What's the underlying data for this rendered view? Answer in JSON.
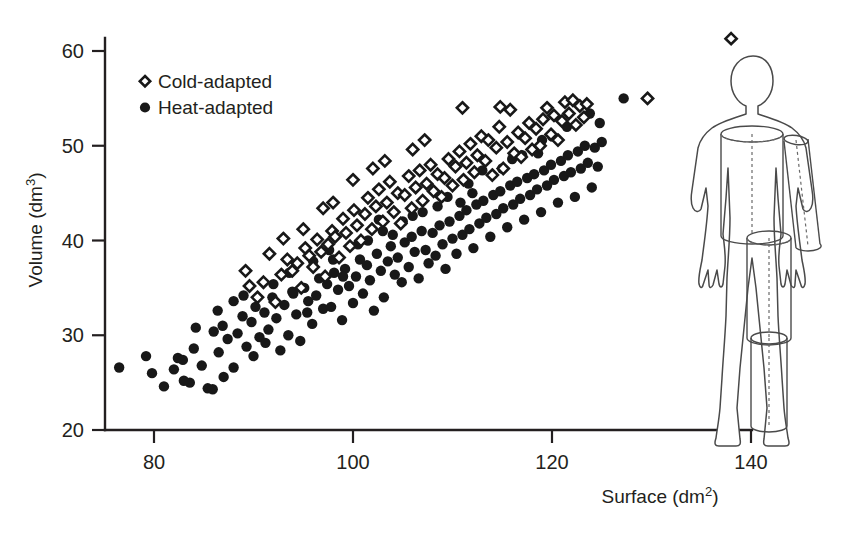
{
  "chart_data": {
    "type": "scatter",
    "title": "",
    "xlabel": "Surface (dm2)",
    "xlabel_base": "Surface (dm",
    "xlabel_sup": "2",
    "xlabel_close": ")",
    "ylabel": "Volume (dm3)",
    "ylabel_base": "Volume (dm",
    "ylabel_sup": "3",
    "ylabel_close": ")",
    "xlim": [
      74,
      143
    ],
    "ylim": [
      20,
      63
    ],
    "xticks": [
      80,
      100,
      120,
      140
    ],
    "yticks": [
      20,
      30,
      40,
      50,
      60
    ],
    "xtick_labels": [
      "80",
      "100",
      "120",
      "140"
    ],
    "ytick_labels": [
      "20",
      "30",
      "40",
      "50",
      "60"
    ],
    "grid": false,
    "legend_position": "top-left-inside",
    "series": [
      {
        "name": "Cold-adapted",
        "marker": "open-diamond",
        "color": "#181818",
        "fill": "#ffffff",
        "points": [
          [
            89.6,
            35.2
          ],
          [
            90.4,
            34.0
          ],
          [
            91.0,
            35.6
          ],
          [
            92.2,
            33.5
          ],
          [
            92.8,
            36.4
          ],
          [
            93.4,
            38.0
          ],
          [
            93.9,
            36.8
          ],
          [
            94.4,
            37.6
          ],
          [
            94.8,
            35.0
          ],
          [
            95.2,
            39.2
          ],
          [
            95.6,
            38.4
          ],
          [
            96.0,
            37.2
          ],
          [
            96.4,
            40.1
          ],
          [
            96.8,
            38.8
          ],
          [
            97.2,
            36.2
          ],
          [
            97.5,
            39.6
          ],
          [
            97.9,
            41.0
          ],
          [
            98.2,
            40.4
          ],
          [
            98.6,
            38.2
          ],
          [
            99.0,
            42.3
          ],
          [
            99.3,
            40.8
          ],
          [
            99.7,
            39.4
          ],
          [
            100.1,
            43.2
          ],
          [
            100.4,
            41.6
          ],
          [
            100.8,
            40.0
          ],
          [
            101.2,
            42.8
          ],
          [
            101.5,
            44.5
          ],
          [
            101.9,
            41.2
          ],
          [
            102.3,
            43.6
          ],
          [
            102.6,
            45.4
          ],
          [
            103.0,
            42.0
          ],
          [
            103.4,
            44.0
          ],
          [
            103.7,
            46.2
          ],
          [
            104.1,
            43.0
          ],
          [
            104.5,
            45.0
          ],
          [
            104.8,
            41.8
          ],
          [
            105.2,
            44.8
          ],
          [
            105.6,
            46.8
          ],
          [
            105.9,
            43.4
          ],
          [
            106.3,
            45.6
          ],
          [
            106.7,
            47.4
          ],
          [
            107.0,
            44.2
          ],
          [
            107.4,
            46.0
          ],
          [
            107.8,
            48.0
          ],
          [
            108.1,
            45.2
          ],
          [
            108.5,
            47.0
          ],
          [
            108.9,
            44.6
          ],
          [
            109.2,
            46.6
          ],
          [
            109.6,
            48.6
          ],
          [
            110.0,
            45.8
          ],
          [
            110.3,
            47.8
          ],
          [
            110.7,
            49.4
          ],
          [
            111.1,
            46.4
          ],
          [
            111.4,
            48.2
          ],
          [
            111.8,
            50.2
          ],
          [
            112.2,
            47.2
          ],
          [
            112.5,
            49.0
          ],
          [
            112.9,
            51.0
          ],
          [
            113.3,
            48.4
          ],
          [
            113.6,
            50.6
          ],
          [
            114.0,
            46.9
          ],
          [
            114.4,
            49.8
          ],
          [
            114.7,
            52.0
          ],
          [
            115.1,
            47.6
          ],
          [
            115.5,
            50.4
          ],
          [
            115.8,
            53.8
          ],
          [
            116.2,
            49.2
          ],
          [
            116.6,
            51.4
          ],
          [
            116.9,
            48.8
          ],
          [
            117.3,
            50.8
          ],
          [
            117.7,
            52.4
          ],
          [
            118.0,
            49.6
          ],
          [
            118.4,
            51.8
          ],
          [
            118.8,
            50.0
          ],
          [
            119.1,
            52.8
          ],
          [
            119.5,
            54.0
          ],
          [
            119.9,
            51.2
          ],
          [
            120.2,
            53.2
          ],
          [
            120.6,
            50.6
          ],
          [
            121.0,
            52.6
          ],
          [
            121.3,
            54.6
          ],
          [
            121.7,
            53.4
          ],
          [
            122.1,
            54.8
          ],
          [
            122.4,
            52.2
          ],
          [
            122.8,
            54.2
          ],
          [
            123.2,
            53.0
          ],
          [
            123.5,
            54.4
          ],
          [
            111.0,
            54.0
          ],
          [
            114.8,
            54.1
          ],
          [
            107.2,
            50.6
          ],
          [
            103.2,
            48.4
          ],
          [
            100.0,
            46.4
          ],
          [
            98.0,
            44.0
          ],
          [
            95.0,
            41.2
          ],
          [
            91.6,
            38.6
          ],
          [
            93.0,
            40.2
          ],
          [
            89.2,
            36.8
          ],
          [
            97.0,
            43.4
          ],
          [
            102.0,
            47.6
          ],
          [
            106.0,
            49.6
          ],
          [
            129.6,
            55.0
          ],
          [
            138.0,
            61.3
          ]
        ]
      },
      {
        "name": "Heat-adapted",
        "marker": "filled-circle",
        "color": "#181818",
        "fill": "#181818",
        "points": [
          [
            76.5,
            26.6
          ],
          [
            79.2,
            27.8
          ],
          [
            79.8,
            26.0
          ],
          [
            81.0,
            24.6
          ],
          [
            82.4,
            27.6
          ],
          [
            82.9,
            27.4
          ],
          [
            83.6,
            25.0
          ],
          [
            84.2,
            30.8
          ],
          [
            84.8,
            26.8
          ],
          [
            85.4,
            24.4
          ],
          [
            85.9,
            24.3
          ],
          [
            86.5,
            28.2
          ],
          [
            86.9,
            31.0
          ],
          [
            87.4,
            29.6
          ],
          [
            88.0,
            26.6
          ],
          [
            88.4,
            30.2
          ],
          [
            88.9,
            32.0
          ],
          [
            89.3,
            28.8
          ],
          [
            89.8,
            31.4
          ],
          [
            90.2,
            33.0
          ],
          [
            90.6,
            29.8
          ],
          [
            91.1,
            32.4
          ],
          [
            91.5,
            30.6
          ],
          [
            91.9,
            34.0
          ],
          [
            92.3,
            31.8
          ],
          [
            92.7,
            28.4
          ],
          [
            93.1,
            33.2
          ],
          [
            93.5,
            30.0
          ],
          [
            93.9,
            34.6
          ],
          [
            94.3,
            32.2
          ],
          [
            94.7,
            29.4
          ],
          [
            95.1,
            35.0
          ],
          [
            95.5,
            33.6
          ],
          [
            95.9,
            31.2
          ],
          [
            96.3,
            34.2
          ],
          [
            96.6,
            36.0
          ],
          [
            97.0,
            32.8
          ],
          [
            97.4,
            35.4
          ],
          [
            97.8,
            33.0
          ],
          [
            98.1,
            36.6
          ],
          [
            98.5,
            34.8
          ],
          [
            98.9,
            31.6
          ],
          [
            99.2,
            37.0
          ],
          [
            99.6,
            35.2
          ],
          [
            100.0,
            33.4
          ],
          [
            100.3,
            36.2
          ],
          [
            100.7,
            38.0
          ],
          [
            101.0,
            34.4
          ],
          [
            101.4,
            37.4
          ],
          [
            101.7,
            35.8
          ],
          [
            102.1,
            32.6
          ],
          [
            102.4,
            38.6
          ],
          [
            102.8,
            36.8
          ],
          [
            103.1,
            34.0
          ],
          [
            103.5,
            37.8
          ],
          [
            103.8,
            39.4
          ],
          [
            104.2,
            36.4
          ],
          [
            104.5,
            38.2
          ],
          [
            104.9,
            35.6
          ],
          [
            105.2,
            39.8
          ],
          [
            105.6,
            37.2
          ],
          [
            105.9,
            40.4
          ],
          [
            106.2,
            38.8
          ],
          [
            106.6,
            36.0
          ],
          [
            106.9,
            41.0
          ],
          [
            107.3,
            39.0
          ],
          [
            107.6,
            37.6
          ],
          [
            108.0,
            40.8
          ],
          [
            108.3,
            38.4
          ],
          [
            108.7,
            41.6
          ],
          [
            109.0,
            39.6
          ],
          [
            109.3,
            37.0
          ],
          [
            109.7,
            42.0
          ],
          [
            110.0,
            40.2
          ],
          [
            110.4,
            38.6
          ],
          [
            110.7,
            42.6
          ],
          [
            111.0,
            40.6
          ],
          [
            111.4,
            43.2
          ],
          [
            111.7,
            41.2
          ],
          [
            112.1,
            39.2
          ],
          [
            112.4,
            43.8
          ],
          [
            112.7,
            41.8
          ],
          [
            113.1,
            44.2
          ],
          [
            113.4,
            42.4
          ],
          [
            113.8,
            40.4
          ],
          [
            114.1,
            44.8
          ],
          [
            114.4,
            42.8
          ],
          [
            114.8,
            45.2
          ],
          [
            115.1,
            43.4
          ],
          [
            115.5,
            41.4
          ],
          [
            115.8,
            45.8
          ],
          [
            116.1,
            43.8
          ],
          [
            116.5,
            46.2
          ],
          [
            116.8,
            44.4
          ],
          [
            117.2,
            42.2
          ],
          [
            117.5,
            46.6
          ],
          [
            117.8,
            44.8
          ],
          [
            118.2,
            47.0
          ],
          [
            118.5,
            45.4
          ],
          [
            118.9,
            43.0
          ],
          [
            119.2,
            47.4
          ],
          [
            119.5,
            45.8
          ],
          [
            119.9,
            48.0
          ],
          [
            120.2,
            46.4
          ],
          [
            120.6,
            44.0
          ],
          [
            120.9,
            48.4
          ],
          [
            121.2,
            46.8
          ],
          [
            121.6,
            49.0
          ],
          [
            121.9,
            47.2
          ],
          [
            122.3,
            44.6
          ],
          [
            122.6,
            49.4
          ],
          [
            122.9,
            47.6
          ],
          [
            123.3,
            50.0
          ],
          [
            123.6,
            48.2
          ],
          [
            124.0,
            45.6
          ],
          [
            124.3,
            49.8
          ],
          [
            124.6,
            47.8
          ],
          [
            125.0,
            50.4
          ],
          [
            119.0,
            50.6
          ],
          [
            117.0,
            49.0
          ],
          [
            113.0,
            47.4
          ],
          [
            109.5,
            44.6
          ],
          [
            106.0,
            42.6
          ],
          [
            103.0,
            41.0
          ],
          [
            100.5,
            39.6
          ],
          [
            96.0,
            37.8
          ],
          [
            92.0,
            35.4
          ],
          [
            88.0,
            33.6
          ],
          [
            86.0,
            30.4
          ],
          [
            84.0,
            28.6
          ],
          [
            87.0,
            25.6
          ],
          [
            83.0,
            25.2
          ],
          [
            90.0,
            27.8
          ],
          [
            94.0,
            34.4
          ],
          [
            98.0,
            38.0
          ],
          [
            101.5,
            40.0
          ],
          [
            105.0,
            42.0
          ],
          [
            108.5,
            43.6
          ],
          [
            112.0,
            45.0
          ],
          [
            115.0,
            47.6
          ],
          [
            120.0,
            51.0
          ],
          [
            121.5,
            52.0
          ],
          [
            123.8,
            53.4
          ],
          [
            127.2,
            55.0
          ],
          [
            110.8,
            44.0
          ],
          [
            104.0,
            40.6
          ],
          [
            99.0,
            36.2
          ],
          [
            95.4,
            32.4
          ],
          [
            91.2,
            29.2
          ],
          [
            89.0,
            34.2
          ],
          [
            93.6,
            36.6
          ],
          [
            97.6,
            39.0
          ],
          [
            102.6,
            42.2
          ],
          [
            107.0,
            43.0
          ],
          [
            111.6,
            46.0
          ],
          [
            116.0,
            48.6
          ],
          [
            118.6,
            49.2
          ],
          [
            124.8,
            52.4
          ],
          [
            86.4,
            32.6
          ],
          [
            82.0,
            26.4
          ]
        ]
      }
    ]
  },
  "legend": {
    "items": [
      {
        "label": "Cold-adapted",
        "marker": "open-diamond"
      },
      {
        "label": "Heat-adapted",
        "marker": "filled-circle"
      }
    ]
  },
  "diagram": {
    "name": "human-body-cylinder-model"
  }
}
